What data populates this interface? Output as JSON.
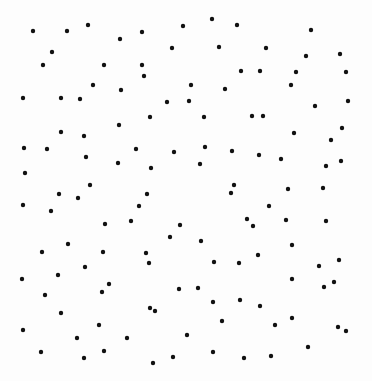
{
  "canvas": {
    "width": 372,
    "height": 381,
    "background": "#fdfdfd"
  },
  "dot_style": {
    "color": "#111111",
    "radius": 2.2
  },
  "dots": [
    [
      33,
      31
    ],
    [
      67,
      31
    ],
    [
      88,
      25
    ],
    [
      120,
      39
    ],
    [
      142,
      32
    ],
    [
      183,
      26
    ],
    [
      52,
      52
    ],
    [
      43,
      65
    ],
    [
      104,
      65
    ],
    [
      142,
      65
    ],
    [
      144,
      76
    ],
    [
      172,
      48
    ],
    [
      93,
      85
    ],
    [
      121,
      90
    ],
    [
      23,
      98
    ],
    [
      61,
      98
    ],
    [
      80,
      99
    ],
    [
      167,
      102
    ],
    [
      150,
      117
    ],
    [
      119,
      125
    ],
    [
      61,
      132
    ],
    [
      84,
      136
    ],
    [
      24,
      148
    ],
    [
      47,
      149
    ],
    [
      136,
      149
    ],
    [
      174,
      152
    ],
    [
      86,
      157
    ],
    [
      118,
      163
    ],
    [
      151,
      168
    ],
    [
      25,
      173
    ],
    [
      90,
      185
    ],
    [
      212,
      19
    ],
    [
      237,
      25
    ],
    [
      311,
      30
    ],
    [
      219,
      47
    ],
    [
      266,
      48
    ],
    [
      306,
      56
    ],
    [
      340,
      54
    ],
    [
      241,
      71
    ],
    [
      260,
      71
    ],
    [
      296,
      72
    ],
    [
      346,
      72
    ],
    [
      191,
      85
    ],
    [
      225,
      89
    ],
    [
      291,
      85
    ],
    [
      189,
      101
    ],
    [
      348,
      101
    ],
    [
      315,
      106
    ],
    [
      204,
      117
    ],
    [
      252,
      116
    ],
    [
      263,
      116
    ],
    [
      342,
      128
    ],
    [
      294,
      133
    ],
    [
      331,
      140
    ],
    [
      205,
      147
    ],
    [
      232,
      151
    ],
    [
      259,
      155
    ],
    [
      281,
      159
    ],
    [
      200,
      164
    ],
    [
      341,
      161
    ],
    [
      326,
      166
    ],
    [
      234,
      185
    ],
    [
      288,
      189
    ],
    [
      323,
      188
    ],
    [
      59,
      194
    ],
    [
      78,
      198
    ],
    [
      147,
      194
    ],
    [
      23,
      205
    ],
    [
      51,
      211
    ],
    [
      139,
      206
    ],
    [
      105,
      224
    ],
    [
      131,
      221
    ],
    [
      180,
      225
    ],
    [
      170,
      237
    ],
    [
      68,
      244
    ],
    [
      42,
      252
    ],
    [
      103,
      252
    ],
    [
      146,
      253
    ],
    [
      149,
      263
    ],
    [
      85,
      267
    ],
    [
      22,
      279
    ],
    [
      58,
      275
    ],
    [
      109,
      284
    ],
    [
      102,
      292
    ],
    [
      179,
      289
    ],
    [
      45,
      295
    ],
    [
      150,
      308
    ],
    [
      155,
      311
    ],
    [
      61,
      313
    ],
    [
      99,
      325
    ],
    [
      23,
      330
    ],
    [
      77,
      338
    ],
    [
      127,
      338
    ],
    [
      41,
      352
    ],
    [
      84,
      358
    ],
    [
      104,
      351
    ],
    [
      153,
      363
    ],
    [
      173,
      357
    ],
    [
      231,
      193
    ],
    [
      269,
      206
    ],
    [
      247,
      219
    ],
    [
      253,
      226
    ],
    [
      286,
      220
    ],
    [
      326,
      221
    ],
    [
      201,
      241
    ],
    [
      292,
      245
    ],
    [
      258,
      255
    ],
    [
      214,
      262
    ],
    [
      239,
      263
    ],
    [
      339,
      260
    ],
    [
      319,
      266
    ],
    [
      292,
      279
    ],
    [
      334,
      282
    ],
    [
      324,
      287
    ],
    [
      198,
      288
    ],
    [
      213,
      302
    ],
    [
      240,
      300
    ],
    [
      260,
      306
    ],
    [
      292,
      318
    ],
    [
      222,
      321
    ],
    [
      275,
      325
    ],
    [
      338,
      327
    ],
    [
      346,
      331
    ],
    [
      187,
      335
    ],
    [
      308,
      347
    ],
    [
      213,
      352
    ],
    [
      244,
      358
    ],
    [
      271,
      356
    ]
  ]
}
